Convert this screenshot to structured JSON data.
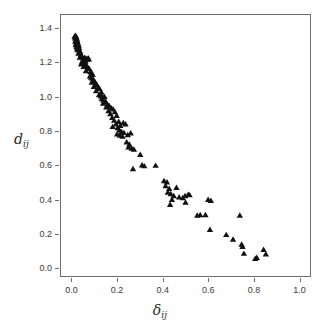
{
  "chart_data": {
    "type": "scatter",
    "title": "",
    "subtitle": "",
    "xlabel": "δij",
    "ylabel": "dij",
    "xlabel_base": "δ",
    "xlabel_sub": "ij",
    "ylabel_base": "d",
    "ylabel_sub": "ij",
    "xlim": [
      -0.05,
      1.05
    ],
    "ylim": [
      -0.05,
      1.48
    ],
    "xticks": [
      0.0,
      0.2,
      0.4,
      0.6,
      0.8,
      1.0
    ],
    "xtick_labels": [
      "0.0",
      "0.2",
      "0.4",
      "0.6",
      "0.8",
      "1.0"
    ],
    "yticks": [
      0.0,
      0.2,
      0.4,
      0.6,
      0.8,
      1.0,
      1.2,
      1.4
    ],
    "ytick_labels": [
      "0.0",
      "0.2",
      "0.4",
      "0.6",
      "0.8",
      "1.0",
      "1.2",
      "1.4"
    ],
    "grid": false,
    "legend": false,
    "marker": "triangle-up",
    "marker_color": "#111111",
    "marker_size_px": 5,
    "frame_color": "#6e6e6e",
    "background_color": "#ffffff",
    "series": [
      {
        "name": "points",
        "points": [
          [
            0.01,
            1.355
          ],
          [
            0.012,
            1.345
          ],
          [
            0.014,
            1.36
          ],
          [
            0.016,
            1.335
          ],
          [
            0.018,
            1.35
          ],
          [
            0.013,
            1.325
          ],
          [
            0.02,
            1.34
          ],
          [
            0.017,
            1.315
          ],
          [
            0.022,
            1.33
          ],
          [
            0.015,
            1.305
          ],
          [
            0.024,
            1.318
          ],
          [
            0.019,
            1.295
          ],
          [
            0.026,
            1.308
          ],
          [
            0.021,
            1.285
          ],
          [
            0.028,
            1.3
          ],
          [
            0.03,
            1.288
          ],
          [
            0.023,
            1.275
          ],
          [
            0.032,
            1.272
          ],
          [
            0.035,
            1.262
          ],
          [
            0.027,
            1.255
          ],
          [
            0.038,
            1.248
          ],
          [
            0.041,
            1.24
          ],
          [
            0.033,
            1.232
          ],
          [
            0.045,
            1.228
          ],
          [
            0.049,
            1.222
          ],
          [
            0.055,
            1.23
          ],
          [
            0.06,
            1.225
          ],
          [
            0.064,
            1.222
          ],
          [
            0.052,
            1.212
          ],
          [
            0.058,
            1.208
          ],
          [
            0.043,
            1.205
          ],
          [
            0.047,
            1.198
          ],
          [
            0.039,
            1.192
          ],
          [
            0.066,
            1.218
          ],
          [
            0.07,
            1.228
          ],
          [
            0.073,
            1.222
          ],
          [
            0.062,
            1.188
          ],
          [
            0.056,
            1.182
          ],
          [
            0.05,
            1.178
          ],
          [
            0.068,
            1.172
          ],
          [
            0.075,
            1.165
          ],
          [
            0.06,
            1.152
          ],
          [
            0.08,
            1.148
          ],
          [
            0.085,
            1.142
          ],
          [
            0.09,
            1.13
          ],
          [
            0.078,
            1.122
          ],
          [
            0.083,
            1.115
          ],
          [
            0.088,
            1.108
          ],
          [
            0.093,
            1.1
          ],
          [
            0.098,
            1.092
          ],
          [
            0.086,
            1.085
          ],
          [
            0.103,
            1.078
          ],
          [
            0.108,
            1.072
          ],
          [
            0.095,
            1.06
          ],
          [
            0.113,
            1.055
          ],
          [
            0.12,
            1.048
          ],
          [
            0.105,
            1.035
          ],
          [
            0.128,
            1.028
          ],
          [
            0.118,
            1.012
          ],
          [
            0.126,
            1.005
          ],
          [
            0.134,
            1.0
          ],
          [
            0.142,
            1.002
          ],
          [
            0.13,
            0.988
          ],
          [
            0.138,
            0.98
          ],
          [
            0.148,
            0.972
          ],
          [
            0.136,
            0.962
          ],
          [
            0.155,
            0.955
          ],
          [
            0.163,
            0.948
          ],
          [
            0.15,
            0.94
          ],
          [
            0.172,
            0.935
          ],
          [
            0.18,
            0.928
          ],
          [
            0.16,
            0.918
          ],
          [
            0.188,
            0.912
          ],
          [
            0.168,
            0.9
          ],
          [
            0.196,
            0.89
          ],
          [
            0.176,
            0.878
          ],
          [
            0.185,
            0.862
          ],
          [
            0.205,
            0.855
          ],
          [
            0.193,
            0.84
          ],
          [
            0.212,
            0.832
          ],
          [
            0.178,
            0.825
          ],
          [
            0.2,
            0.818
          ],
          [
            0.225,
            0.848
          ],
          [
            0.235,
            0.84
          ],
          [
            0.208,
            0.805
          ],
          [
            0.218,
            0.795
          ],
          [
            0.228,
            0.79
          ],
          [
            0.198,
            0.782
          ],
          [
            0.21,
            0.775
          ],
          [
            0.222,
            0.768
          ],
          [
            0.245,
            0.778
          ],
          [
            0.258,
            0.788
          ],
          [
            0.24,
            0.735
          ],
          [
            0.252,
            0.722
          ],
          [
            0.248,
            0.705
          ],
          [
            0.262,
            0.698
          ],
          [
            0.272,
            0.692
          ],
          [
            0.3,
            0.662
          ],
          [
            0.268,
            0.578
          ],
          [
            0.308,
            0.6
          ],
          [
            0.318,
            0.595
          ],
          [
            0.368,
            0.598
          ],
          [
            0.405,
            0.508
          ],
          [
            0.418,
            0.5
          ],
          [
            0.412,
            0.478
          ],
          [
            0.428,
            0.462
          ],
          [
            0.422,
            0.44
          ],
          [
            0.435,
            0.432
          ],
          [
            0.46,
            0.468
          ],
          [
            0.448,
            0.42
          ],
          [
            0.44,
            0.398
          ],
          [
            0.432,
            0.368
          ],
          [
            0.472,
            0.412
          ],
          [
            0.488,
            0.408
          ],
          [
            0.498,
            0.42
          ],
          [
            0.5,
            0.382
          ],
          [
            0.512,
            0.428
          ],
          [
            0.518,
            0.425
          ],
          [
            0.552,
            0.305
          ],
          [
            0.565,
            0.308
          ],
          [
            0.588,
            0.308
          ],
          [
            0.6,
            0.398
          ],
          [
            0.612,
            0.392
          ],
          [
            0.608,
            0.222
          ],
          [
            0.68,
            0.192
          ],
          [
            0.71,
            0.165
          ],
          [
            0.74,
            0.305
          ],
          [
            0.748,
            0.135
          ],
          [
            0.752,
            0.122
          ],
          [
            0.758,
            0.082
          ],
          [
            0.808,
            0.052
          ],
          [
            0.815,
            0.058
          ],
          [
            0.845,
            0.105
          ],
          [
            0.855,
            0.078
          ]
        ]
      }
    ]
  }
}
